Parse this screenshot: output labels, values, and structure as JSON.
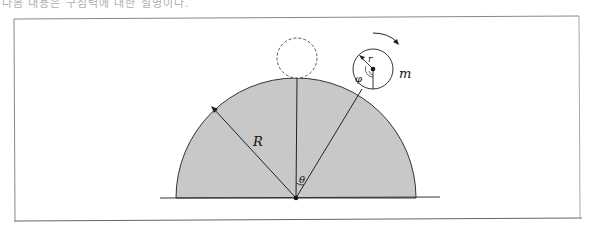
{
  "header": {
    "text": "다음 내용은 구심력에 대한 설명이다."
  },
  "diagram": {
    "labels": {
      "big_radius": "R",
      "small_radius": "r",
      "mass": "m",
      "theta": "θ",
      "phi": "φ"
    },
    "colors": {
      "hemisphere_fill": "#c8c8c8",
      "stroke": "#222222",
      "frame": "#888888"
    }
  }
}
